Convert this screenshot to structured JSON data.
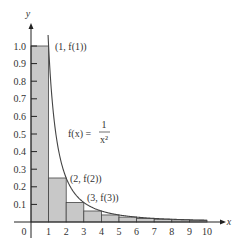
{
  "chart_data": {
    "type": "area",
    "title": "",
    "xlabel": "x",
    "ylabel": "y",
    "xlim": [
      0,
      10
    ],
    "ylim": [
      0,
      1.0
    ],
    "grid": false,
    "function": "f(x) = 1/x^2",
    "x_ticks": [
      0,
      1,
      2,
      3,
      4,
      5,
      6,
      7,
      8,
      9,
      10
    ],
    "y_ticks": [
      0.1,
      0.2,
      0.3,
      0.4,
      0.5,
      0.6,
      0.7,
      0.8,
      0.9,
      1.0
    ],
    "x_tick_labels": [
      "0",
      "1",
      "2",
      "3",
      "4",
      "5",
      "6",
      "7",
      "8",
      "9",
      "10"
    ],
    "y_tick_labels": [
      "0.1",
      "0.2",
      "0.3",
      "0.4",
      "0.5",
      "0.6",
      "0.7",
      "0.8",
      "0.9",
      "1.0"
    ],
    "rectangles": [
      {
        "x0": 0,
        "x1": 1,
        "height": 1.0
      },
      {
        "x0": 1,
        "x1": 2,
        "height": 0.25
      },
      {
        "x0": 2,
        "x1": 3,
        "height": 0.111
      },
      {
        "x0": 3,
        "x1": 4,
        "height": 0.0625
      },
      {
        "x0": 4,
        "x1": 5,
        "height": 0.04
      },
      {
        "x0": 5,
        "x1": 6,
        "height": 0.0278
      },
      {
        "x0": 6,
        "x1": 7,
        "height": 0.0204
      },
      {
        "x0": 7,
        "x1": 8,
        "height": 0.0156
      },
      {
        "x0": 8,
        "x1": 9,
        "height": 0.0123
      },
      {
        "x0": 9,
        "x1": 10,
        "height": 0.01
      }
    ],
    "points": [
      {
        "x": 1,
        "y": 1.0,
        "label": "(1, f(1))"
      },
      {
        "x": 2,
        "y": 0.25,
        "label": "(2, f(2))"
      },
      {
        "x": 3,
        "y": 0.111,
        "label": "(3, f(3))"
      }
    ],
    "annotations": {
      "function_label": "f(x) =",
      "numerator": "1",
      "denominator": "x²"
    }
  },
  "colors": {
    "fill": "#c8c8c8",
    "stroke": "#444444",
    "axis": "#222222"
  }
}
